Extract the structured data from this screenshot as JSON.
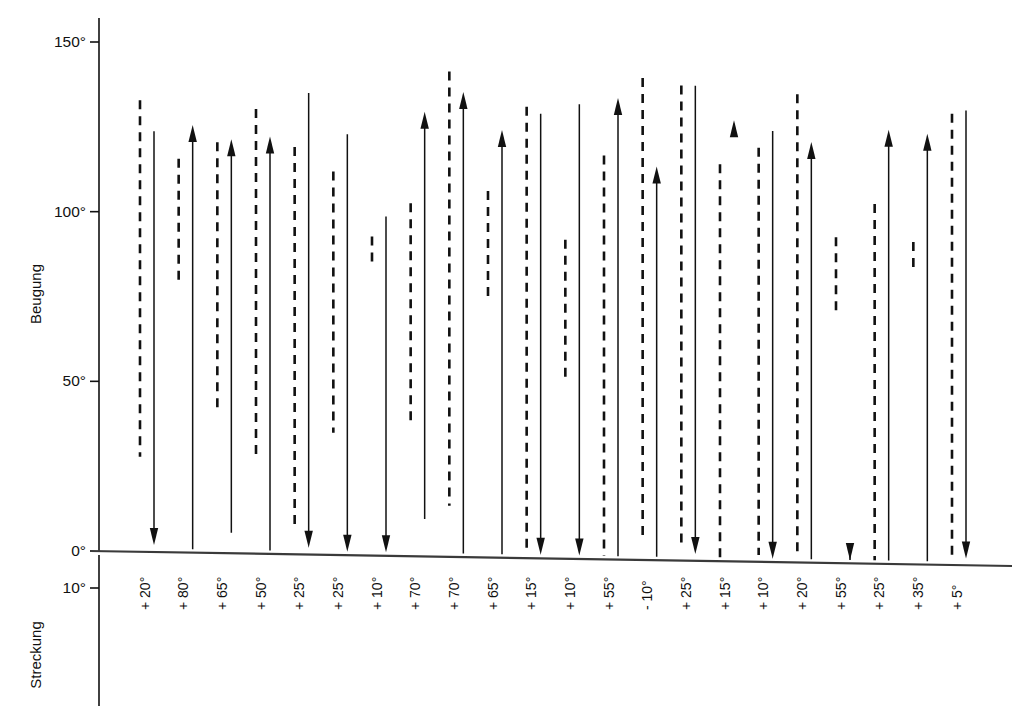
{
  "chart_data": {
    "type": "bar",
    "title": "",
    "subtitle": "",
    "xlabel": "",
    "ylabel_upper": "Beugung",
    "ylabel_lower": "Streckung",
    "y_tick_labels_upper": [
      "150°",
      "100°",
      "50°",
      "0°"
    ],
    "y_tick_values_upper": [
      150,
      100,
      50,
      0
    ],
    "y_tick_labels_lower": [
      "10°"
    ],
    "y_tick_values_lower": [
      -10
    ],
    "ylim": [
      -12,
      158
    ],
    "grid": false,
    "legend": null,
    "categories": [
      "+ 20°",
      "+ 80°",
      "+ 65°",
      "+ 50°",
      "+ 25°",
      "+ 25°",
      "+ 10°",
      "+ 70°",
      "+ 70°",
      "+ 65°",
      "+ 15°",
      "+ 10°",
      "+ 55°",
      "- 10°",
      "+ 25°",
      "+ 15°",
      "+ 10°",
      "+ 20°",
      "+ 55°",
      "+ 25°",
      "+ 35°",
      "+ 5°"
    ],
    "series": [
      {
        "name": "Bewegungsausmaß vor Operation (gestrichelt)",
        "style": "dashed",
        "tops": [
          133,
          116,
          121,
          131,
          120,
          113,
          94,
          104,
          143,
          108,
          133,
          94,
          119,
          142,
          140,
          117,
          122,
          138,
          96,
          106,
          95,
          133
        ],
        "bottoms": [
          28,
          79,
          41,
          29,
          7,
          36,
          86,
          38,
          15,
          75,
          3,
          53,
          1,
          7,
          4,
          1,
          2,
          2,
          74,
          1,
          87,
          1
        ]
      },
      {
        "name": "Bewegungsausmaß nach Operation (Pfeil)",
        "style": "arrow",
        "starts": [
          124,
          1,
          6,
          1,
          136,
          124,
          100,
          11,
          1,
          1,
          131,
          134,
          1,
          1,
          140,
          129,
          127,
          1,
          1,
          1,
          1,
          134
        ],
        "ends": [
          2,
          126,
          122,
          123,
          2,
          1,
          1,
          131,
          137,
          126,
          1,
          1,
          136,
          116,
          2,
          130,
          1,
          124,
          1,
          128,
          127,
          2
        ]
      }
    ]
  },
  "footer": {
    "top_right_faint": ""
  }
}
